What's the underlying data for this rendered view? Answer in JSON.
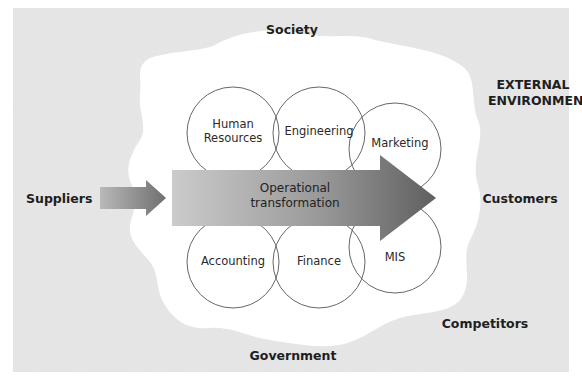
{
  "diagram": {
    "external_environment_label": "EXTERNAL ENVIRONMENT",
    "external_environment_lines": [
      "EXTERNAL",
      "ENVIRONMENT"
    ],
    "environment_factors": {
      "top": "Society",
      "bottom": "Government",
      "left": "Suppliers",
      "right": "Customers",
      "bottom_right": "Competitors"
    },
    "departments": [
      {
        "name": "Human Resources",
        "lines": [
          "Human",
          "Resources"
        ],
        "position": "top-left"
      },
      {
        "name": "Engineering",
        "lines": [
          "Engineering"
        ],
        "position": "top-center"
      },
      {
        "name": "Marketing",
        "lines": [
          "Marketing"
        ],
        "position": "top-right"
      },
      {
        "name": "Accounting",
        "lines": [
          "Accounting"
        ],
        "position": "bottom-left"
      },
      {
        "name": "Finance",
        "lines": [
          "Finance"
        ],
        "position": "bottom-center"
      },
      {
        "name": "MIS",
        "lines": [
          "MIS"
        ],
        "position": "bottom-right"
      }
    ],
    "central_process": {
      "label": "Operational transformation",
      "lines": [
        "Operational",
        "transformation"
      ]
    },
    "flow": {
      "input_from": "Suppliers",
      "output_to": "Customers"
    },
    "colors": {
      "environment_background": "#e6e6e6",
      "organization_blob": "#ffffff",
      "circle_stroke": "#555555",
      "arrow_gradient_start": "#c8c8c8",
      "arrow_gradient_end": "#6a6a6a",
      "text": "#1e1e1e"
    }
  }
}
